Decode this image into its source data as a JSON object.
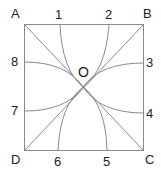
{
  "diagram": {
    "corners": {
      "A": "A",
      "B": "B",
      "C": "C",
      "D": "D"
    },
    "center": "O",
    "points": [
      "1",
      "2",
      "3",
      "4",
      "5",
      "6",
      "7",
      "8"
    ],
    "stroke_color": "#8a8a8a"
  }
}
